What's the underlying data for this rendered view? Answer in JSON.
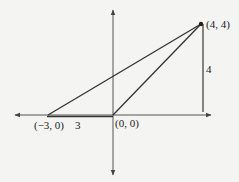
{
  "diagram": {
    "points": [
      {
        "name": "A",
        "label": "(−3, 0)"
      },
      {
        "name": "O",
        "label": "(0, 0)"
      },
      {
        "name": "B",
        "label": "(4, 4)"
      }
    ],
    "segment_labels": {
      "base": "3",
      "height": "4"
    },
    "colors": {
      "line": "#333333",
      "background": "#f4f4f2"
    }
  }
}
